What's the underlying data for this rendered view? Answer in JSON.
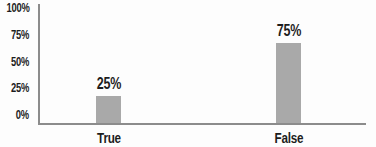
{
  "chart_data": {
    "type": "bar",
    "categories": [
      "True",
      "False"
    ],
    "values": [
      25,
      75
    ],
    "data_labels": [
      "25%",
      "75%"
    ],
    "y_ticks": [
      {
        "value": 0,
        "label": "0%"
      },
      {
        "value": 25,
        "label": "25%"
      },
      {
        "value": 50,
        "label": "50%"
      },
      {
        "value": 75,
        "label": "75%"
      },
      {
        "value": 100,
        "label": "100%"
      }
    ],
    "title": "",
    "xlabel": "",
    "ylabel": "",
    "ylim": [
      0,
      100
    ],
    "grid": false,
    "legend": false,
    "colors": {
      "bar": "#a9a9a9",
      "axis": "#8c8c8c",
      "text": "#1d1d1d",
      "background": "#fdfdfd"
    }
  }
}
